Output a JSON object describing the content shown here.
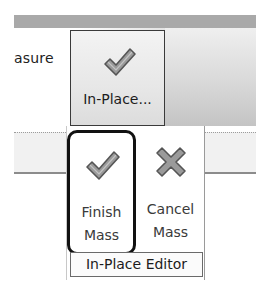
{
  "ribbon": {
    "partial_label": "asure",
    "inplace_button": {
      "label": "In-Place...",
      "icon": "checkmark-icon"
    }
  },
  "panel": {
    "title": "In-Place Editor",
    "buttons": [
      {
        "label_line1": "Finish",
        "label_line2": "Mass",
        "icon": "checkmark-icon",
        "highlighted": true
      },
      {
        "label_line1": "Cancel",
        "label_line2": "Mass",
        "icon": "x-icon",
        "highlighted": false
      }
    ]
  },
  "colors": {
    "icon_fill": "#9a9a9a",
    "icon_outline": "#555555",
    "highlight_border": "#111111",
    "ribbon_band": "#a9a9a9"
  }
}
